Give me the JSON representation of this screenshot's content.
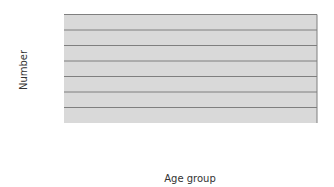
{
  "chart_data": {
    "type": "bar",
    "title": "",
    "xlabel": "Age group",
    "ylabel": "Number",
    "ylim": [
      0,
      1400
    ],
    "yticks": [
      0,
      200,
      400,
      600,
      800,
      1000,
      1200,
      1400
    ],
    "grid": true,
    "legend": null,
    "categories": [
      "0 to 5",
      "5 to 9",
      "10 to 14",
      "15 to 19",
      "20 to 24",
      "25 to 29",
      "30 to 34",
      "35 and over"
    ],
    "category_lines": [
      [
        "0 to 5"
      ],
      [
        "5 to 9"
      ],
      [
        "10 to 14"
      ],
      [
        "15 to 19"
      ],
      [
        "20 to 24"
      ],
      [
        "25 to 29"
      ],
      [
        "30 to 34"
      ],
      [
        "35 and",
        "over"
      ]
    ],
    "values": [
      720,
      1160,
      1250,
      1160,
      980,
      590,
      430,
      600
    ]
  },
  "colors": {
    "plot_background": "#d9d9d9",
    "bar_fill": "#bfbfbf",
    "bar_stroke": "#404040",
    "grid": "#7f7f7f",
    "axis": "#404040",
    "text": "#333333"
  }
}
